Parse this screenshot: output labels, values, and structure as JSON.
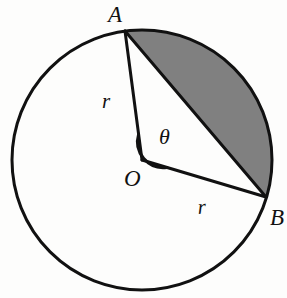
{
  "figure": {
    "type": "geometry-diagram",
    "background_color": "#fdfdfc",
    "stroke_color": "#111111",
    "shade_color": "#808080"
  },
  "labels": {
    "point_a": "A",
    "point_b": "B",
    "center_o": "O",
    "radius_oa": "r",
    "radius_ob": "r",
    "angle": "θ"
  },
  "geometry": {
    "circle": {
      "center_x": 142,
      "center_y": 160,
      "radius": 130,
      "stroke_width": 3
    },
    "point_a": {
      "x": 125,
      "y": 31
    },
    "point_b": {
      "x": 266,
      "y": 197
    },
    "center": {
      "x": 142,
      "y": 160
    },
    "angle_arc": {
      "radius": 26,
      "stroke_width": 3
    },
    "shaded_segment": {
      "description": "major-side circular segment between chord AB and arc A->B clockwise through the right of the circle",
      "fill": "#808080"
    }
  },
  "label_positions": {
    "point_a": {
      "x": 108,
      "y": 22
    },
    "point_b": {
      "x": 270,
      "y": 225
    },
    "center_o": {
      "x": 124,
      "y": 186
    },
    "radius_oa": {
      "x": 102,
      "y": 108
    },
    "radius_ob": {
      "x": 198,
      "y": 214
    },
    "angle": {
      "x": 160,
      "y": 143
    }
  }
}
